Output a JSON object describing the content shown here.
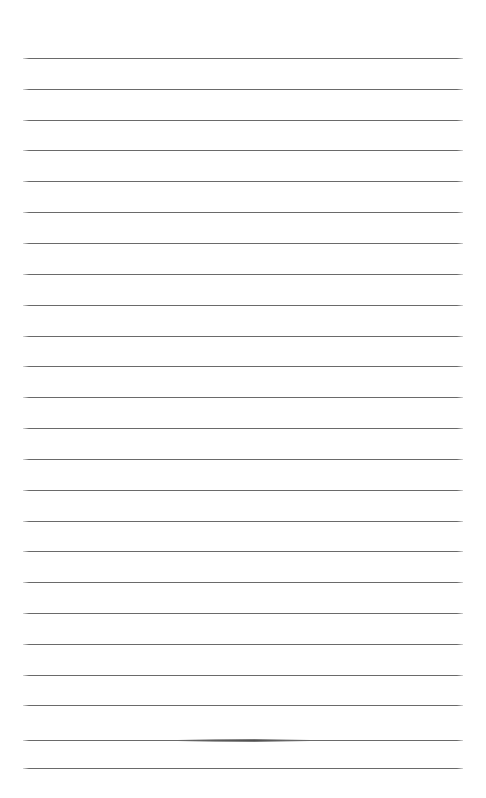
{
  "page": {
    "kind": "blank-lined-paper",
    "width": 486,
    "height": 798,
    "background_color": "#ffffff",
    "text_content": "",
    "body_text": ""
  },
  "rules": {
    "count": 24,
    "color": "#6a6a6a",
    "thickness_px": 1,
    "left_x": 23,
    "right_x": 463,
    "line_width": 440,
    "first_line_y": 58,
    "spacing_px": 30.85,
    "y_positions": [
      58,
      89,
      120,
      150,
      181,
      212,
      243,
      274,
      305,
      336,
      366,
      397,
      428,
      459,
      490,
      521,
      551,
      582,
      613,
      644,
      675,
      705,
      740,
      768
    ]
  },
  "marks": [
    {
      "name": "graphite-smudge",
      "on_line_index": 22,
      "x": 178,
      "y": 739,
      "width": 132,
      "color": "#505050"
    }
  ]
}
